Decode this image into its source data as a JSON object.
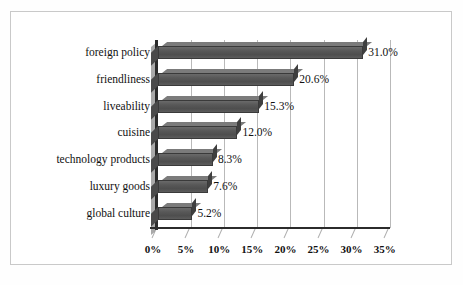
{
  "chart_data": {
    "type": "bar",
    "orientation": "horizontal",
    "title": "",
    "subtitle": "",
    "xlabel": "",
    "ylabel": "",
    "xlim": [
      0,
      35
    ],
    "grid": true,
    "legend": "none",
    "style": "3d-excel-horizontal-bar",
    "units": "%",
    "categories": [
      "foreign policy",
      "friendliness",
      "liveability",
      "cuisine",
      "technology products",
      "luxury goods",
      "global culture"
    ],
    "values": [
      31.0,
      20.6,
      15.3,
      12.0,
      8.3,
      7.6,
      5.2
    ],
    "data_labels": [
      "31.0%",
      "20.6%",
      "15.3%",
      "12.0%",
      "8.3%",
      "7.6%",
      "5.2%"
    ],
    "xticks": [
      0,
      5,
      10,
      15,
      20,
      25,
      30,
      35
    ],
    "xtick_labels": [
      "0%",
      "5%",
      "10%",
      "15%",
      "20%",
      "25%",
      "30%",
      "35%"
    ],
    "colors": {
      "bar": "#565656",
      "bar_top": "#7b7b7b",
      "bar_edge": "#3a3a3a",
      "gridline": "#b9b9b9",
      "axis": "#2b2b2b",
      "plot_background": "#ffffff",
      "page_background": "#ffffff",
      "border": "#c9c9c9",
      "text": "#111111"
    }
  }
}
